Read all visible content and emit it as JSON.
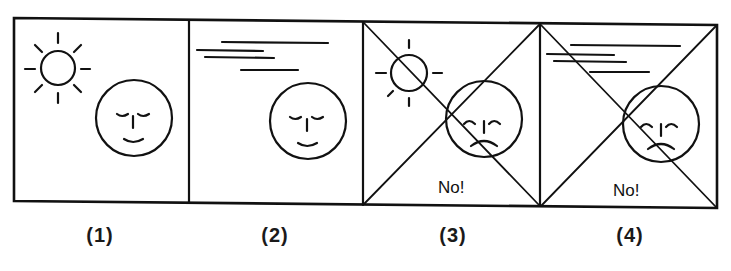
{
  "figure": {
    "stroke_color": "#111111",
    "background": "#ffffff",
    "panels": [
      {
        "id": 1,
        "caption": "(1)",
        "weather": "sun",
        "face": "content",
        "crossed": false,
        "text": ""
      },
      {
        "id": 2,
        "caption": "(2)",
        "weather": "wind-lines",
        "face": "content",
        "crossed": false,
        "text": ""
      },
      {
        "id": 3,
        "caption": "(3)",
        "weather": "sun",
        "face": "frowning",
        "crossed": true,
        "text": "No!"
      },
      {
        "id": 4,
        "caption": "(4)",
        "weather": "wind-lines",
        "face": "frowning",
        "crossed": true,
        "text": "No!"
      }
    ]
  }
}
